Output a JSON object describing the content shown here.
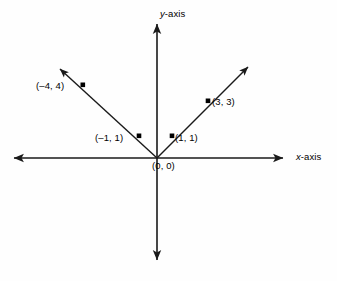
{
  "figure": {
    "background_color": "#fefefe",
    "line_color": "#1a1a1a"
  },
  "axes": {
    "x_label_prefix": "x",
    "x_label_suffix": "-axis",
    "y_label_prefix": "y",
    "y_label_suffix": "-axis",
    "origin": {
      "x": 157,
      "y": 158
    },
    "x_axis": {
      "left_tip_x": 12,
      "right_tip_x": 285,
      "y": 158
    },
    "y_axis": {
      "top_tip_y": 22,
      "bottom_tip_y": 262,
      "x": 157
    }
  },
  "points": [
    {
      "id": "p-neg4-4",
      "label": "(–4, 4)",
      "marker_x": 83,
      "marker_y": 85
    },
    {
      "id": "p-3-3",
      "label": "(3, 3)",
      "marker_x": 208,
      "marker_y": 101
    },
    {
      "id": "p-neg1-1",
      "label": "(–1, 1)",
      "marker_x": 139,
      "marker_y": 136
    },
    {
      "id": "p-1-1",
      "label": "(1, 1)",
      "marker_x": 172,
      "marker_y": 136
    },
    {
      "id": "p-0-0",
      "label": "(0, 0)",
      "marker_x": 157,
      "marker_y": 158
    }
  ],
  "rays": [
    {
      "id": "ray-left",
      "from_x": 157,
      "from_y": 158,
      "to_x": 58,
      "to_y": 67
    },
    {
      "id": "ray-right",
      "from_x": 157,
      "from_y": 158,
      "to_x": 250,
      "to_y": 65
    }
  ]
}
